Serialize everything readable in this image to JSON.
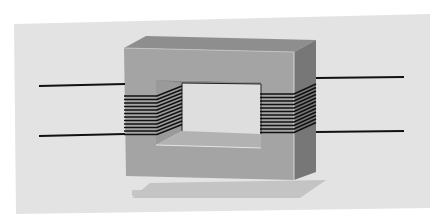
{
  "figure": {
    "colors": {
      "page_background": "#ffffff",
      "panel_background": "#e3e3e3",
      "core_front": "#a3a3a3",
      "core_top": "#8c8c8c",
      "core_side": "#7a7a7a",
      "window_inner": "#dcdcdc",
      "window_floor": "#b0b0b0",
      "coil_wire": "#111111",
      "lead_wire": "#111111",
      "shadow": "#c4c4c4"
    },
    "coils": [
      {
        "name": "primary-coil",
        "turns": 12
      },
      {
        "name": "secondary-coil",
        "turns": 12
      }
    ],
    "leads": [
      {
        "name": "primary-lead-top"
      },
      {
        "name": "primary-lead-bottom"
      },
      {
        "name": "secondary-lead-top"
      },
      {
        "name": "secondary-lead-bottom"
      }
    ]
  }
}
